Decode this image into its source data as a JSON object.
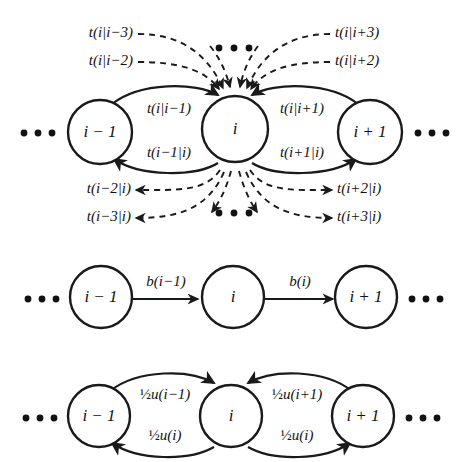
{
  "figure": {
    "background_color": "#ffffff",
    "ink_color": "#1a1a1a",
    "panels": [
      {
        "id": "panel-transition-rates",
        "name": "long-range-transition-panel",
        "nodes": [
          {
            "id": "left",
            "label": "i − 1"
          },
          {
            "id": "center",
            "label": "i"
          },
          {
            "id": "right",
            "label": "i + 1"
          }
        ],
        "ellipsis_left": "• • •",
        "ellipsis_right": "• • •",
        "ellipsis_top": "• • •",
        "ellipsis_bottom": "• • •",
        "solid_edges": [
          {
            "id": "in-from-left",
            "label": "t(i|i−1)"
          },
          {
            "id": "out-to-left",
            "label": "t(i−1|i)"
          },
          {
            "id": "in-from-right",
            "label": "t(i|i+1)"
          },
          {
            "id": "out-to-right",
            "label": "t(i+1|i)"
          }
        ],
        "dashed_inbound": [
          {
            "id": "in-left-3",
            "label": "t(i|i−3)"
          },
          {
            "id": "in-left-2",
            "label": "t(i|i−2)"
          },
          {
            "id": "in-right-3",
            "label": "t(i|i+3)"
          },
          {
            "id": "in-right-2",
            "label": "t(i|i+2)"
          }
        ],
        "dashed_outbound": [
          {
            "id": "out-left-2",
            "label": "t(i−2|i)"
          },
          {
            "id": "out-left-3",
            "label": "t(i−3|i)"
          },
          {
            "id": "out-right-2",
            "label": "t(i+2|i)"
          },
          {
            "id": "out-right-3",
            "label": "t(i+3|i)"
          }
        ]
      },
      {
        "id": "panel-birth-rates",
        "name": "birth-rate-panel",
        "nodes": [
          {
            "id": "left",
            "label": "i − 1"
          },
          {
            "id": "center",
            "label": "i"
          },
          {
            "id": "right",
            "label": "i + 1"
          }
        ],
        "ellipsis_left": "• • •",
        "ellipsis_right": "• • •",
        "straight_edges": [
          {
            "id": "left-to-center",
            "label": "b(i−1)"
          },
          {
            "id": "center-to-right",
            "label": "b(i)"
          }
        ]
      },
      {
        "id": "panel-symmetric-rates",
        "name": "symmetric-rate-panel",
        "nodes": [
          {
            "id": "left",
            "label": "i − 1"
          },
          {
            "id": "center",
            "label": "i"
          },
          {
            "id": "right",
            "label": "i + 1"
          }
        ],
        "ellipsis_left": "• • •",
        "ellipsis_right": "• • •",
        "curved_edges": [
          {
            "id": "left-top",
            "frac": "½",
            "rest": "u(i−1)"
          },
          {
            "id": "left-bottom",
            "frac": "½",
            "rest": "u(i)"
          },
          {
            "id": "right-top",
            "frac": "½",
            "rest": "u(i+1)"
          },
          {
            "id": "right-bottom",
            "frac": "½",
            "rest": "u(i)"
          }
        ]
      }
    ]
  }
}
